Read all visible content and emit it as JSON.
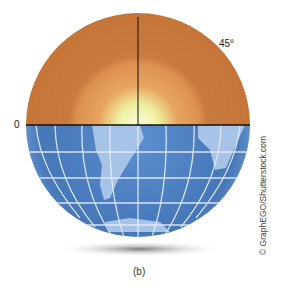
{
  "figure": {
    "labels": {
      "equator": "0",
      "angle": "45°"
    },
    "caption": "(b)",
    "credit": "© GraphEGO/Shutterstock.com",
    "colors": {
      "hemisphere": "#c97a40",
      "glow": "#f4f6c0",
      "ocean": "#4a7fc0",
      "land": "#a8c4e8",
      "grid": "#e6eef8"
    }
  }
}
